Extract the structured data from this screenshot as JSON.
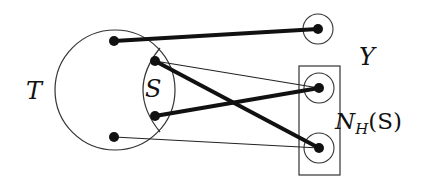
{
  "diagram": {
    "labels": {
      "T": "T",
      "S": "S",
      "Y": "Y",
      "N_main": "N",
      "N_sub": "H",
      "N_arg": "(S)"
    },
    "colors": {
      "stroke": "#333333",
      "vertex": "#111111",
      "background": "#ffffff"
    },
    "sets": {
      "T": {
        "type": "circle",
        "cx": 115,
        "cy": 90,
        "r": 60
      },
      "S": {
        "type": "lens",
        "within": "T"
      },
      "N_H_S": {
        "type": "rectangle",
        "x": 299,
        "y": 66,
        "w": 41,
        "h": 109
      }
    },
    "vertices": [
      {
        "id": "t1",
        "set": "T",
        "x": 114,
        "y": 41
      },
      {
        "id": "s1",
        "set": "S",
        "x": 155,
        "y": 61
      },
      {
        "id": "s2",
        "set": "S",
        "x": 155,
        "y": 116
      },
      {
        "id": "t2",
        "set": "T",
        "x": 114,
        "y": 137
      },
      {
        "id": "y1",
        "set": "Y",
        "x": 318,
        "y": 29,
        "circled": true
      },
      {
        "id": "n1",
        "set": "N_H(S)",
        "x": 319,
        "y": 88,
        "circled": true
      },
      {
        "id": "n2",
        "set": "N_H(S)",
        "x": 319,
        "y": 148,
        "circled": true
      }
    ],
    "edges": [
      {
        "from": "t1",
        "to": "y1",
        "weight": "thick"
      },
      {
        "from": "s1",
        "to": "n1",
        "weight": "thin"
      },
      {
        "from": "s1",
        "to": "n2",
        "weight": "thick"
      },
      {
        "from": "s2",
        "to": "n1",
        "weight": "thick"
      },
      {
        "from": "t2",
        "to": "n2",
        "weight": "thin"
      }
    ]
  }
}
